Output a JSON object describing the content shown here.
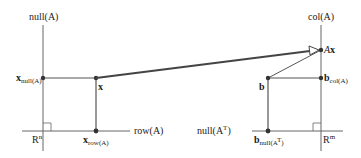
{
  "diagram": {
    "left_space": {
      "name": "R^n",
      "label_base": "R",
      "label_sup": "n",
      "vertical_axis": {
        "label": "null(A)"
      },
      "horizontal_axis": {
        "label": "row(A)"
      },
      "points": {
        "x": {
          "label": "x"
        },
        "x_null": {
          "label_base": "x",
          "label_sub": "null(A)"
        },
        "x_row": {
          "label_base": "x",
          "label_sub": "row(A)"
        }
      }
    },
    "right_space": {
      "name": "R^m",
      "label_base": "R",
      "label_sup": "m",
      "vertical_axis": {
        "label": "col(A)"
      },
      "horizontal_axis": {
        "label_base": "null(A",
        "label_sup": "T",
        "label_end": ")"
      },
      "points": {
        "Ax": {
          "label_prefix": "A",
          "label_bold": "x"
        },
        "b": {
          "label": "b"
        },
        "b_col": {
          "label_base": "b",
          "label_sub": "col(A)"
        },
        "b_null": {
          "label_base": "b",
          "label_sub": "null(A",
          "label_sub_sup": "T",
          "label_sub_end": ")"
        }
      }
    },
    "arrows": [
      {
        "from": "x",
        "to": "Ax",
        "meaning": "A maps x to Ax"
      }
    ],
    "colors": {
      "axis": "#555555",
      "line": "#444444",
      "mapping_arrow": "#444444",
      "point": "#333333"
    }
  }
}
